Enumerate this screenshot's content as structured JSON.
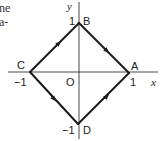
{
  "text_fragments": {
    "line1": "ne",
    "line2": "a-"
  },
  "axes": {
    "x_label": "x",
    "y_label": "y",
    "origin_label": "O",
    "x_ticks": [
      "−1",
      "1"
    ],
    "y_ticks": [
      "1",
      "−1"
    ]
  },
  "vertices": {
    "A": {
      "label": "A",
      "coord": [
        1,
        0
      ]
    },
    "B": {
      "label": "B",
      "coord": [
        0,
        1
      ]
    },
    "C": {
      "label": "C",
      "coord": [
        -1,
        0
      ]
    },
    "D": {
      "label": "D",
      "coord": [
        0,
        -1
      ]
    }
  },
  "edges": [
    {
      "from": "C",
      "to": "B"
    },
    {
      "from": "B",
      "to": "A"
    },
    {
      "from": "C",
      "to": "D"
    },
    {
      "from": "D",
      "to": "A"
    }
  ],
  "colors": {
    "stroke": "#1a1a1a",
    "axis": "#333333"
  }
}
